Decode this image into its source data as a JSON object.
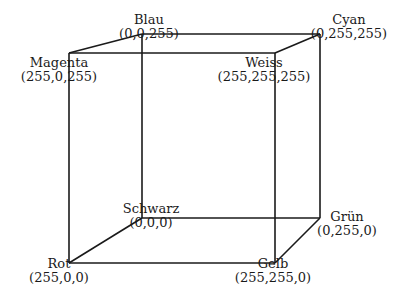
{
  "diagram": {
    "type": "rgb-color-cube",
    "line_color": "#1a1a1a",
    "vertices": [
      {
        "id": "blau",
        "name": "Blau",
        "rgb": "(0,0,255)"
      },
      {
        "id": "cyan",
        "name": "Cyan",
        "rgb": "(0,255,255)"
      },
      {
        "id": "magenta",
        "name": "Magenta",
        "rgb": "(255,0,255)"
      },
      {
        "id": "weiss",
        "name": "Weiss",
        "rgb": "(255,255,255)"
      },
      {
        "id": "schwarz",
        "name": "Schwarz",
        "rgb": "(0,0,0)"
      },
      {
        "id": "gruen",
        "name": "Grün",
        "rgb": "(0,255,0)"
      },
      {
        "id": "rot",
        "name": "Rot",
        "rgb": "(255,0,0)"
      },
      {
        "id": "gelb",
        "name": "Gelb",
        "rgb": "(255,255,0)"
      }
    ]
  }
}
